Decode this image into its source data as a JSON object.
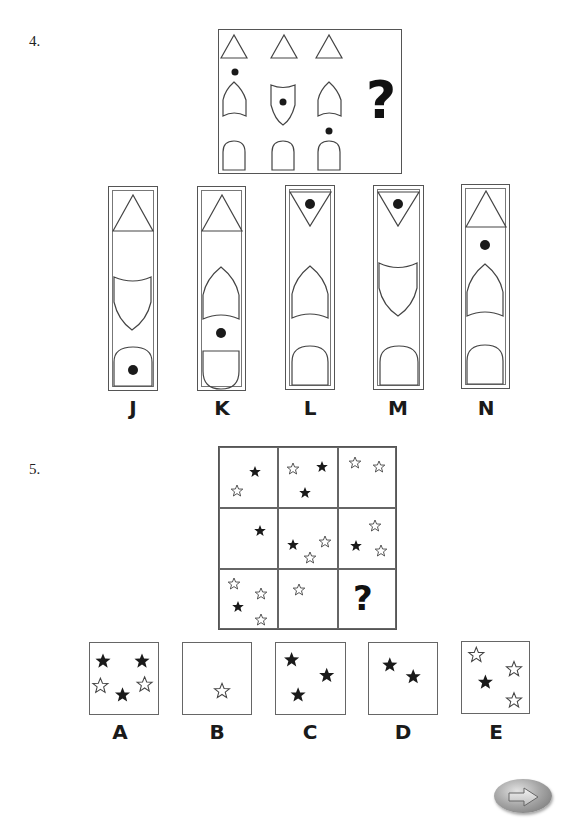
{
  "questions": [
    {
      "number": "4.",
      "matrix": {
        "columns": [
          {
            "top": "triangle-up",
            "middle": "arch-shield-dot-above",
            "bottom": "arch-door"
          },
          {
            "top": "triangle-up",
            "middle": "shield-dot-inside",
            "bottom": "arch-door"
          },
          {
            "top": "triangle-up",
            "middle": "arch-shield",
            "bottom": "arch-door-dot-above"
          }
        ],
        "missing_symbol": "?"
      },
      "options": [
        {
          "label": "J",
          "top": "triangle-up",
          "middle": "shield",
          "bottom": "arch-door-dot-inside"
        },
        {
          "label": "K",
          "top": "triangle-up",
          "middle": "arch-shield",
          "bottom": "u-shape-dot-above"
        },
        {
          "label": "L",
          "top": "triangle-down-dot-inside",
          "middle": "arch-shield",
          "bottom": "arch-door"
        },
        {
          "label": "M",
          "top": "triangle-down-dot-inside",
          "middle": "shield",
          "bottom": "arch-door"
        },
        {
          "label": "N",
          "top": "triangle-up",
          "middle": "arch-shield-dot-above",
          "bottom": "arch-door"
        }
      ]
    },
    {
      "number": "5.",
      "grid": {
        "cells": [
          {
            "black": 1,
            "white": 1
          },
          {
            "black": 2,
            "white": 1
          },
          {
            "black": 0,
            "white": 2
          },
          {
            "black": 1,
            "white": 0
          },
          {
            "black": 1,
            "white": 2
          },
          {
            "black": 1,
            "white": 2
          },
          {
            "black": 1,
            "white": 3
          },
          {
            "black": 0,
            "white": 1
          },
          {
            "missing": "?"
          }
        ]
      },
      "options": [
        {
          "label": "A",
          "black": 3,
          "white": 2
        },
        {
          "label": "B",
          "black": 0,
          "white": 1
        },
        {
          "label": "C",
          "black": 3,
          "white": 0
        },
        {
          "label": "D",
          "black": 2,
          "white": 0
        },
        {
          "label": "E",
          "black": 1,
          "white": 3
        }
      ]
    }
  ],
  "navigation": {
    "next_icon": "arrow-right-icon"
  }
}
